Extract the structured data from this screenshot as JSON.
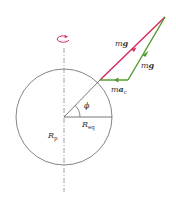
{
  "diagram": {
    "type": "earth-rotation-gravity-vectors",
    "colors": {
      "outline": "#777777",
      "axis": "#888888",
      "red_vector": "#d6285a",
      "green_vector": "#4c9a2a",
      "rotation_arrow": "#d6285a",
      "label_text": "#333333"
    },
    "labels": {
      "top_mg": {
        "m": "m",
        "g": "g"
      },
      "right_mg": {
        "m": "m",
        "g": "g"
      },
      "mac": {
        "m": "m",
        "a": "a",
        "sub": "c"
      },
      "phi": "ϕ",
      "req": {
        "R": "R",
        "sub": "eq"
      },
      "rp": {
        "R": "R",
        "sub": "p"
      }
    },
    "geometry": {
      "circle_center": [
        64,
        117
      ],
      "circle_radius": 48,
      "triangle": {
        "top": [
          165,
          17
        ],
        "bottom_left": [
          100,
          80
        ],
        "bottom_right": [
          128,
          80
        ]
      }
    }
  }
}
